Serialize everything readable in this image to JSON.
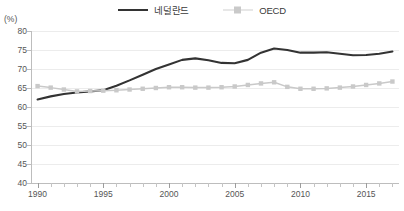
{
  "unit_label": "(%)",
  "legend": {
    "position": "top-center",
    "entries": [
      {
        "label": "네덜란드",
        "color": "#333333",
        "marker": "none"
      },
      {
        "label": "OECD",
        "color": "#c9c9c9",
        "marker": "square"
      }
    ]
  },
  "chart_data": {
    "type": "line",
    "title": "",
    "xlabel": "",
    "ylabel": "(%)",
    "ylim": [
      40,
      80
    ],
    "xlim": [
      1989.5,
      2017.5
    ],
    "yticks": [
      40,
      45,
      50,
      55,
      60,
      65,
      70,
      75,
      80
    ],
    "ytick_labels": [
      "40",
      "45",
      "50",
      "55",
      "60",
      "65",
      "70",
      "75",
      "80"
    ],
    "xticks": [
      1990,
      1991,
      1992,
      1993,
      1994,
      1995,
      1996,
      1997,
      1998,
      1999,
      2000,
      2001,
      2002,
      2003,
      2004,
      2005,
      2006,
      2007,
      2008,
      2009,
      2010,
      2011,
      2012,
      2013,
      2014,
      2015,
      2016,
      2017
    ],
    "xtick_labels_major": [
      "1990",
      "1995",
      "2000",
      "2005",
      "2010",
      "2015"
    ],
    "xticks_major": [
      1990,
      1995,
      2000,
      2005,
      2010,
      2015
    ],
    "grid": "horizontal",
    "legend_position": "top-center",
    "x": [
      1990,
      1991,
      1992,
      1993,
      1994,
      1995,
      1996,
      1997,
      1998,
      1999,
      2000,
      2001,
      2002,
      2003,
      2004,
      2005,
      2006,
      2007,
      2008,
      2009,
      2010,
      2011,
      2012,
      2013,
      2014,
      2015,
      2016,
      2017
    ],
    "series": [
      {
        "name": "네덜란드",
        "color": "#333333",
        "marker": "none",
        "values": [
          62.0,
          62.8,
          63.4,
          63.8,
          64.1,
          64.4,
          65.6,
          67.0,
          68.5,
          70.0,
          71.2,
          72.4,
          72.8,
          72.3,
          71.6,
          71.5,
          72.4,
          74.3,
          75.4,
          75.0,
          74.3,
          74.3,
          74.4,
          74.0,
          73.6,
          73.7,
          74.0,
          74.6
        ]
      },
      {
        "name": "OECD",
        "color": "#c9c9c9",
        "marker": "square",
        "values": [
          65.5,
          65.1,
          64.6,
          64.1,
          64.2,
          64.3,
          64.4,
          64.6,
          64.8,
          65.0,
          65.2,
          65.2,
          65.1,
          65.1,
          65.2,
          65.4,
          65.8,
          66.2,
          66.5,
          65.3,
          64.8,
          64.8,
          64.9,
          65.1,
          65.4,
          65.8,
          66.2,
          66.7
        ]
      }
    ]
  }
}
